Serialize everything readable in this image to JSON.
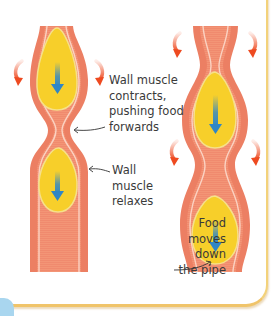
{
  "diagram": {
    "labels": {
      "contract": "Wall muscle\ncontracts,\npushing food\nforwards",
      "relax": "Wall\nmuscle\nrelaxes",
      "food": "Food\nmoves\ndown\nthe pipe"
    },
    "colors": {
      "wall_outer": "#ee8468",
      "wall_inner": "#f59a7c",
      "wall_stripe": "#fbd2c2",
      "food": "#f7cf2a",
      "food_edge": "#f6e08a",
      "arrow_blue": "#2f86c6",
      "contraction_arrow": "#ee4a20",
      "frame_border": "#f0c46a",
      "corner_blue": "#a9d6ef"
    },
    "icons": [
      "down-arrow-icon",
      "contraction-arrow-icon",
      "pointer-arrow-icon"
    ]
  }
}
